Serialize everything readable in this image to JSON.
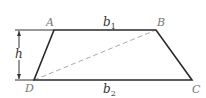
{
  "diagram": {
    "type": "trapezoid",
    "vertices": {
      "A": {
        "label": "A",
        "x": 54,
        "y": 30
      },
      "B": {
        "label": "B",
        "x": 156,
        "y": 30
      },
      "C": {
        "label": "C",
        "x": 192,
        "y": 80
      },
      "D": {
        "label": "D",
        "x": 34,
        "y": 80
      }
    },
    "labels": {
      "top_base": "b",
      "top_base_sub": "1",
      "bottom_base": "b",
      "bottom_base_sub": "2",
      "height": "h"
    },
    "diagonal": {
      "from": "D",
      "to": "B",
      "style": "dashed"
    },
    "colors": {
      "edge": "#2a2a2a",
      "diagonal": "#aaaaaa",
      "height_marker": "#333333",
      "vertex_label": "#777777"
    }
  }
}
